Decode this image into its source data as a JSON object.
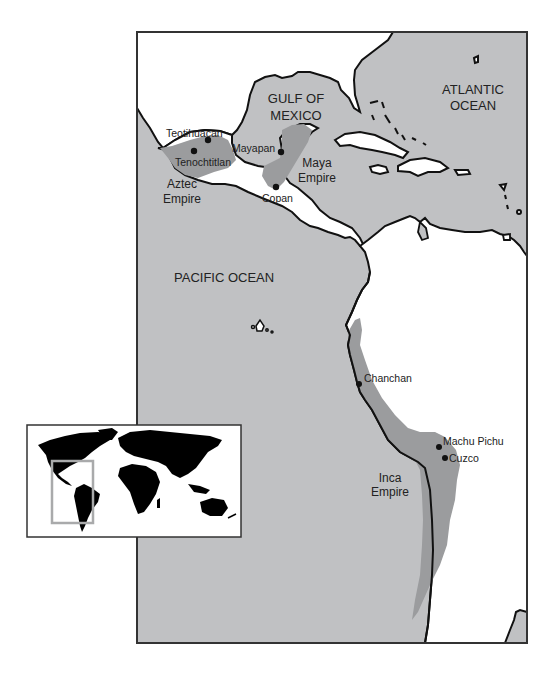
{
  "map": {
    "colors": {
      "ocean": "#c0c1c3",
      "land": "#ffffff",
      "empire": "#9b9c9e",
      "coastline": "#111111",
      "frame": "#333333",
      "inset_land": "#000000",
      "inset_highlight": "#a9aaab"
    },
    "oceans": [
      {
        "line1": "GULF OF",
        "line2": "MEXICO"
      },
      {
        "line1": "ATLANTIC",
        "line2": "OCEAN"
      },
      {
        "line1": "PACIFIC OCEAN"
      }
    ],
    "empires": [
      {
        "line1": "Aztec",
        "line2": "Empire"
      },
      {
        "line1": "Maya",
        "line2": "Empire"
      },
      {
        "line1": "Inca",
        "line2": "Empire"
      }
    ],
    "cities": [
      {
        "name": "Teotihuacan"
      },
      {
        "name": "Tenochtitlan"
      },
      {
        "name": "Mayapan"
      },
      {
        "name": "Copan"
      },
      {
        "name": "Chanchan"
      },
      {
        "name": "Machu Pichu"
      },
      {
        "name": "Cuzco"
      }
    ],
    "inset": {
      "description": "World locator map highlighting the Americas"
    }
  }
}
